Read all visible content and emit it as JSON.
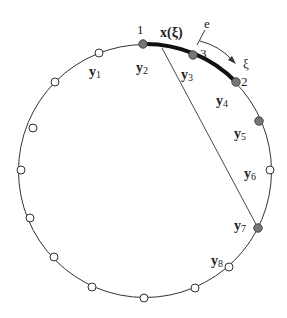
{
  "diagram": {
    "colors": {
      "stroke": "#333333",
      "open_node_fill": "#ffffff",
      "filled_node_fill": "#777777",
      "element_stroke": "#111111"
    },
    "element": {
      "label": "x(ξ)",
      "node_labels": {
        "n1": "1",
        "n2": "2",
        "n3": "3"
      },
      "normal_label": "e",
      "direction_label": "ξ"
    },
    "source_points": [
      {
        "label": "y",
        "sub": "1"
      },
      {
        "label": "y",
        "sub": "2"
      },
      {
        "label": "y",
        "sub": "3"
      },
      {
        "label": "y",
        "sub": "4"
      },
      {
        "label": "y",
        "sub": "5"
      },
      {
        "label": "y",
        "sub": "6"
      },
      {
        "label": "y",
        "sub": "7"
      },
      {
        "label": "y",
        "sub": "8"
      }
    ]
  }
}
